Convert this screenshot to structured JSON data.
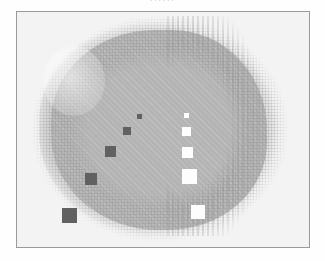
{
  "figure": {
    "clipped_caption_above": "......",
    "frame": {
      "border_color": "#9a9a9a",
      "background_color": "#f3f3f3"
    }
  },
  "chart_data": {
    "type": "scatter",
    "title": "",
    "subtitle": "",
    "xlabel": "",
    "ylabel": "",
    "xlim": [
      0,
      294
    ],
    "ylim": [
      0,
      237
    ],
    "grid": false,
    "legend_position": "none",
    "axis_ticks_visible": false,
    "background_field": {
      "name": "dithered-blob",
      "description": "large irregular mid-gray halftone blob filling the frame, soft dithered edges",
      "fill_color": "#b4b4b4",
      "dither_color": "#969696",
      "center": [
        142,
        118
      ],
      "width": 240,
      "height": 214
    },
    "series": [
      {
        "name": "dark-squares",
        "marker": "square",
        "color": "#616161",
        "points": [
          {
            "label": "d1",
            "x": 122,
            "y": 104,
            "size": 5
          },
          {
            "label": "d2",
            "x": 110,
            "y": 119,
            "size": 8
          },
          {
            "label": "d3",
            "x": 93,
            "y": 139,
            "size": 11
          },
          {
            "label": "d4",
            "x": 74,
            "y": 167,
            "size": 12
          },
          {
            "label": "d5",
            "x": 52,
            "y": 203,
            "size": 15
          }
        ]
      },
      {
        "name": "white-squares",
        "marker": "square",
        "color": "#fdfdfd",
        "points": [
          {
            "label": "w1",
            "x": 169,
            "y": 103,
            "size": 5
          },
          {
            "label": "w2",
            "x": 169,
            "y": 119,
            "size": 9
          },
          {
            "label": "w3",
            "x": 170,
            "y": 140,
            "size": 11
          },
          {
            "label": "w4",
            "x": 172,
            "y": 164,
            "size": 15
          },
          {
            "label": "w5",
            "x": 181,
            "y": 200,
            "size": 14
          }
        ]
      }
    ]
  }
}
